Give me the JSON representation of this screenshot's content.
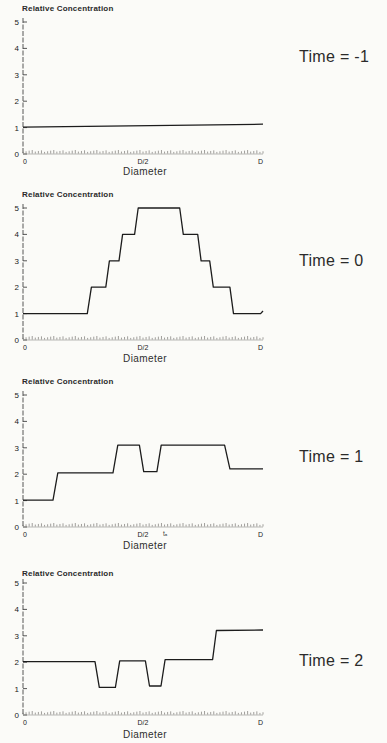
{
  "page": {
    "background": "#fbfbf8",
    "line_color": "#1c1c1c",
    "axis_color": "#444444",
    "figure_description": "Four stacked step-line plots of Relative Concentration versus Diameter at Time = -1, 0, 1, 2"
  },
  "chart_data": [
    {
      "type": "line",
      "title": "Relative Concentration",
      "xlabel": "Diameter",
      "time_label": "Time = -1",
      "x_ticks": [
        "0",
        "D/2",
        "D"
      ],
      "y_ticks": [
        "0",
        "1",
        "2",
        "3",
        "4",
        "5"
      ],
      "ylim": [
        0,
        5
      ],
      "xlim": [
        0,
        1
      ],
      "grid": false,
      "legend": "none",
      "annotation": "",
      "series": [
        {
          "name": "relative-concentration",
          "points": [
            [
              0,
              1.02
            ],
            [
              1,
              1.13
            ]
          ]
        }
      ]
    },
    {
      "type": "line",
      "title": "Relative Concentration",
      "xlabel": "Diameter",
      "time_label": "Time = 0",
      "x_ticks": [
        "0",
        "D/2",
        "D"
      ],
      "y_ticks": [
        "0",
        "1",
        "2",
        "3",
        "4",
        "5"
      ],
      "ylim": [
        0,
        5
      ],
      "xlim": [
        0,
        1
      ],
      "grid": false,
      "legend": "none",
      "annotation": "",
      "series": [
        {
          "name": "relative-concentration",
          "points": [
            [
              0,
              1
            ],
            [
              0.268,
              1
            ],
            [
              0.285,
              2
            ],
            [
              0.345,
              2
            ],
            [
              0.36,
              3
            ],
            [
              0.4,
              3
            ],
            [
              0.415,
              4
            ],
            [
              0.465,
              4
            ],
            [
              0.48,
              5
            ],
            [
              0.653,
              5
            ],
            [
              0.668,
              4
            ],
            [
              0.728,
              4
            ],
            [
              0.742,
              3
            ],
            [
              0.778,
              3
            ],
            [
              0.793,
              2
            ],
            [
              0.862,
              2
            ],
            [
              0.877,
              1
            ],
            [
              0.99,
              1
            ],
            [
              1,
              1.1
            ]
          ]
        }
      ]
    },
    {
      "type": "line",
      "title": "Relative Concentration",
      "xlabel": "Diameter",
      "time_label": "Time = 1",
      "x_ticks": [
        "0",
        "D/2",
        "D"
      ],
      "y_ticks": [
        "0",
        "1",
        "2",
        "3",
        "4",
        "5"
      ],
      "ylim": [
        0,
        5
      ],
      "xlim": [
        0,
        1
      ],
      "grid": false,
      "legend": "none",
      "annotation": "tₐ",
      "series": [
        {
          "name": "relative-concentration",
          "points": [
            [
              0,
              1.02
            ],
            [
              0.125,
              1.02
            ],
            [
              0.145,
              2.05
            ],
            [
              0.375,
              2.05
            ],
            [
              0.395,
              3.1
            ],
            [
              0.485,
              3.1
            ],
            [
              0.503,
              2.1
            ],
            [
              0.558,
              2.1
            ],
            [
              0.576,
              3.1
            ],
            [
              0.84,
              3.1
            ],
            [
              0.862,
              2.2
            ],
            [
              1,
              2.2
            ]
          ]
        }
      ]
    },
    {
      "type": "line",
      "title": "Relative Concentration",
      "xlabel": "Diameter",
      "time_label": "Time = 2",
      "x_ticks": [
        "0",
        "D/2",
        "D"
      ],
      "y_ticks": [
        "0",
        "1",
        "2",
        "3",
        "4",
        "5"
      ],
      "ylim": [
        0,
        5
      ],
      "xlim": [
        0,
        1
      ],
      "grid": false,
      "legend": "none",
      "annotation": "",
      "series": [
        {
          "name": "relative-concentration",
          "points": [
            [
              0,
              2.02
            ],
            [
              0.3,
              2.02
            ],
            [
              0.318,
              1.05
            ],
            [
              0.385,
              1.05
            ],
            [
              0.403,
              2.05
            ],
            [
              0.51,
              2.05
            ],
            [
              0.527,
              1.1
            ],
            [
              0.575,
              1.1
            ],
            [
              0.592,
              2.1
            ],
            [
              0.79,
              2.1
            ],
            [
              0.806,
              3.2
            ],
            [
              1,
              3.22
            ]
          ]
        }
      ]
    }
  ]
}
